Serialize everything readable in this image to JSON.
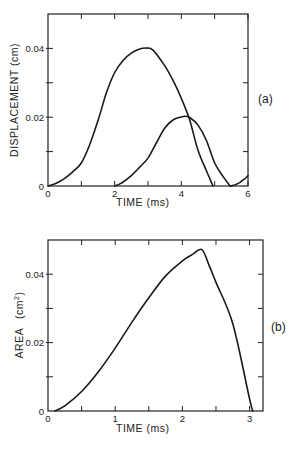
{
  "chart_data": [
    {
      "id": "a",
      "type": "line",
      "panel_label": "(a)",
      "xlabel": "TIME (ms)",
      "ylabel": "DISPLACEMENT (cm)",
      "xlim": [
        0,
        6
      ],
      "ylim": [
        0,
        0.05
      ],
      "xticks": [
        0,
        1,
        2,
        3,
        4,
        5,
        6
      ],
      "xtick_labels": [
        "0",
        "",
        "2",
        "",
        "4",
        "",
        "6"
      ],
      "yticks": [
        0,
        0.01,
        0.02,
        0.03,
        0.04
      ],
      "ytick_labels": [
        "0",
        "",
        "0.02",
        "",
        "0.04"
      ],
      "grid": false,
      "series": [
        {
          "name": "curve-1",
          "x": [
            0,
            0.25,
            0.5,
            0.75,
            1.0,
            1.25,
            1.5,
            1.75,
            2.0,
            2.25,
            2.5,
            2.75,
            2.95,
            3.15,
            3.5,
            3.75,
            4.0,
            4.25,
            4.5,
            4.75,
            4.95
          ],
          "y": [
            0,
            0.0008,
            0.0022,
            0.0042,
            0.0067,
            0.012,
            0.019,
            0.027,
            0.033,
            0.0365,
            0.0386,
            0.0398,
            0.0401,
            0.0395,
            0.035,
            0.0307,
            0.0255,
            0.0192,
            0.0104,
            0.0045,
            0
          ]
        },
        {
          "name": "curve-2",
          "x": [
            2.0,
            2.2,
            2.5,
            2.75,
            3.0,
            3.25,
            3.5,
            3.75,
            4.0,
            4.1,
            4.25,
            4.5,
            4.75,
            5.0,
            5.25,
            5.46
          ],
          "y": [
            0,
            0.0008,
            0.003,
            0.0055,
            0.0081,
            0.0125,
            0.0168,
            0.0192,
            0.0201,
            0.0203,
            0.0199,
            0.0177,
            0.0133,
            0.0067,
            0.0028,
            0
          ]
        },
        {
          "name": "curve-3",
          "x": [
            5.46,
            5.6,
            5.75,
            5.9,
            6.0
          ],
          "y": [
            0,
            0.0003,
            0.001,
            0.0021,
            0.003
          ]
        }
      ]
    },
    {
      "id": "b",
      "type": "line",
      "panel_label": "(b)",
      "xlabel": "TIME (ms)",
      "ylabel": "AREA (cm²)",
      "ylabel_main": "AREA",
      "ylabel_unit": "(cm",
      "ylabel_sup": "2",
      "ylabel_close": ")",
      "xlim": [
        0,
        3.2
      ],
      "ylim": [
        0,
        0.05
      ],
      "xticks": [
        0,
        0.5,
        1,
        1.5,
        2,
        2.5,
        3
      ],
      "xtick_labels": [
        "0",
        "",
        "1",
        "",
        "2",
        "",
        "3"
      ],
      "yticks": [
        0,
        0.01,
        0.02,
        0.03,
        0.04
      ],
      "ytick_labels": [
        "0",
        "",
        "0.02",
        "",
        "0.04"
      ],
      "grid": false,
      "series": [
        {
          "name": "area",
          "x": [
            0.1,
            0.25,
            0.5,
            0.75,
            1.0,
            1.25,
            1.5,
            1.75,
            2.0,
            2.15,
            2.29,
            2.4,
            2.5,
            2.75,
            3.0,
            3.05
          ],
          "y": [
            0,
            0.0015,
            0.0057,
            0.0115,
            0.0184,
            0.026,
            0.0331,
            0.0395,
            0.0439,
            0.0458,
            0.0472,
            0.0425,
            0.0376,
            0.0255,
            0.0035,
            0
          ]
        }
      ]
    }
  ]
}
